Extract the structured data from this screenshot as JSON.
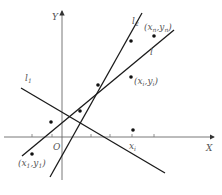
{
  "diagram": {
    "type": "regression-lines-illustration",
    "axes": {
      "x_label": "X",
      "y_label": "Y",
      "origin_label": "O"
    },
    "lines": [
      {
        "id": "l1",
        "label": "l",
        "subscript": "1"
      },
      {
        "id": "l2",
        "label": "l",
        "subscript": "2"
      },
      {
        "id": "l",
        "label": "l",
        "subscript": ""
      }
    ],
    "point_labels": {
      "first": {
        "x": "x",
        "x_sub": "1",
        "y": "y",
        "y_sub": "1"
      },
      "ith": {
        "x": "x",
        "x_sub": "i",
        "y": "y",
        "y_sub": "i"
      },
      "nth": {
        "x": "x",
        "x_sub": "n",
        "y": "y",
        "y_sub": "n"
      }
    },
    "x_tick_label": {
      "text": "x",
      "sub": "i"
    },
    "colors": {
      "lines": "#1a1a1a",
      "axes": "#6a6a6a",
      "labels": "#555555",
      "background": "#ffffff"
    }
  }
}
